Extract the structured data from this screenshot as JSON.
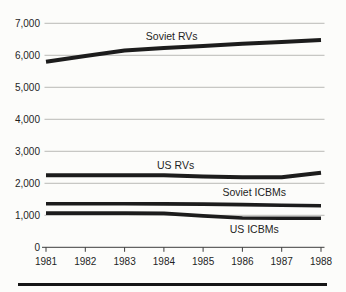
{
  "figure": {
    "background_color": "#fcfcfa",
    "bottom_rule_color": "#161616"
  },
  "chart_data": {
    "type": "line",
    "title": "",
    "xlabel": "",
    "ylabel": "",
    "x": [
      1981,
      1982,
      1983,
      1984,
      1985,
      1986,
      1987,
      1988
    ],
    "x_tick_labels": [
      "1981",
      "1982",
      "1983",
      "1984",
      "1985",
      "1986",
      "1987",
      "1988"
    ],
    "ylim": [
      0,
      7000
    ],
    "y_ticks": [
      0,
      1000,
      2000,
      3000,
      4000,
      5000,
      6000,
      7000
    ],
    "y_tick_labels": [
      "0",
      "1,000",
      "2,000",
      "3,000",
      "4,000",
      "5,000",
      "6,000",
      "7,000"
    ],
    "grid": "horizontal",
    "grid_color": "#a8a8a6",
    "axis_color": "#3c3c3c",
    "text_color": "#1f1f1f",
    "legend_position": "inline-annotations",
    "series": [
      {
        "name": "Soviet RVs",
        "color": "#1c1c1c",
        "width": 4,
        "values": [
          5800,
          5980,
          6150,
          6230,
          6290,
          6360,
          6420,
          6480
        ]
      },
      {
        "name": "US RVs",
        "color": "#1c1c1c",
        "width": 4,
        "values": [
          2250,
          2250,
          2250,
          2250,
          2210,
          2190,
          2190,
          2330
        ]
      },
      {
        "name": "Soviet ICBMs",
        "color": "#1c1c1c",
        "width": 3.6,
        "values": [
          1360,
          1360,
          1358,
          1355,
          1350,
          1335,
          1315,
          1300
        ]
      },
      {
        "name": "US ICBMs",
        "color": "#1c1c1c",
        "width": 3.6,
        "values": [
          1070,
          1070,
          1070,
          1060,
          980,
          915,
          910,
          905
        ]
      }
    ],
    "annotations": [
      {
        "text": "Soviet RVs",
        "x": 1984.2,
        "y": 6600
      },
      {
        "text": "US RVs",
        "x": 1984.3,
        "y": 2560
      },
      {
        "text": "Soviet ICBMs",
        "x": 1986.3,
        "y": 1700
      },
      {
        "text": "US ICBMs",
        "x": 1986.3,
        "y": 570
      }
    ]
  }
}
